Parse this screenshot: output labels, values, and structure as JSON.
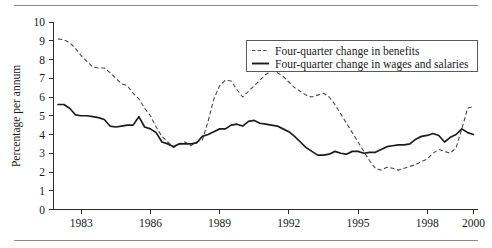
{
  "chart_data": {
    "type": "line",
    "title": "",
    "subtitle": "",
    "xlabel": "",
    "ylabel": "Percentage per annum",
    "xlim": [
      1981.8,
      2000.2
    ],
    "ylim": [
      0,
      10
    ],
    "yticks": [
      0,
      1,
      2,
      3,
      4,
      5,
      6,
      7,
      8,
      9,
      10
    ],
    "ytick_labels": [
      "0",
      "1",
      "2",
      "3",
      "4",
      "5",
      "6",
      "7",
      "8",
      "9",
      "10"
    ],
    "xticks": [
      1983,
      1986,
      1989,
      1992,
      1995,
      1998,
      2000
    ],
    "xtick_labels": [
      "1983",
      "1986",
      "1989",
      "1992",
      "1995",
      "1998",
      "2000"
    ],
    "grid": false,
    "legend_position": "top-right",
    "series": [
      {
        "name": "Four-quarter change in benefits",
        "style": "dashed",
        "color": "#4a4a4a",
        "x": [
          1982.0,
          1982.25,
          1982.5,
          1982.75,
          1983.0,
          1983.25,
          1983.5,
          1983.75,
          1984.0,
          1984.25,
          1984.5,
          1984.75,
          1985.0,
          1985.25,
          1985.5,
          1985.75,
          1986.0,
          1986.25,
          1986.5,
          1986.75,
          1987.0,
          1987.25,
          1987.5,
          1987.75,
          1988.0,
          1988.25,
          1988.5,
          1988.75,
          1989.0,
          1989.25,
          1989.5,
          1989.75,
          1990.0,
          1990.25,
          1990.5,
          1990.75,
          1991.0,
          1991.25,
          1991.5,
          1991.75,
          1992.0,
          1992.25,
          1992.5,
          1992.75,
          1993.0,
          1993.25,
          1993.5,
          1993.75,
          1994.0,
          1994.25,
          1994.5,
          1994.75,
          1995.0,
          1995.25,
          1995.5,
          1995.75,
          1996.0,
          1996.25,
          1996.5,
          1996.75,
          1997.0,
          1997.25,
          1997.5,
          1997.75,
          1998.0,
          1998.25,
          1998.5,
          1998.75,
          1999.0,
          1999.25,
          1999.5,
          1999.75,
          2000.0
        ],
        "values": [
          9.1,
          9.05,
          8.9,
          8.6,
          8.2,
          7.9,
          7.6,
          7.55,
          7.55,
          7.3,
          7.0,
          6.7,
          6.6,
          6.2,
          5.9,
          5.4,
          5.0,
          4.4,
          3.9,
          3.6,
          3.3,
          3.5,
          3.6,
          3.4,
          3.6,
          3.7,
          4.7,
          5.9,
          6.6,
          6.9,
          6.85,
          6.4,
          6.0,
          6.3,
          6.6,
          6.9,
          7.2,
          7.4,
          7.3,
          7.1,
          6.8,
          6.5,
          6.3,
          6.1,
          6.0,
          6.1,
          6.2,
          6.0,
          5.6,
          5.1,
          4.6,
          4.1,
          3.6,
          3.1,
          2.6,
          2.2,
          2.1,
          2.25,
          2.2,
          2.1,
          2.2,
          2.3,
          2.4,
          2.55,
          2.7,
          3.0,
          3.2,
          3.1,
          3.0,
          3.3,
          4.3,
          5.4,
          5.5
        ]
      },
      {
        "name": "Four-quarter change in wages and salaries",
        "style": "solid",
        "color": "#1c1c1c",
        "x": [
          1982.0,
          1982.25,
          1982.5,
          1982.75,
          1983.0,
          1983.25,
          1983.5,
          1983.75,
          1984.0,
          1984.25,
          1984.5,
          1984.75,
          1985.0,
          1985.25,
          1985.5,
          1985.75,
          1986.0,
          1986.25,
          1986.5,
          1986.75,
          1987.0,
          1987.25,
          1987.5,
          1987.75,
          1988.0,
          1988.25,
          1988.5,
          1988.75,
          1989.0,
          1989.25,
          1989.5,
          1989.75,
          1990.0,
          1990.25,
          1990.5,
          1990.75,
          1991.0,
          1991.25,
          1991.5,
          1991.75,
          1992.0,
          1992.25,
          1992.5,
          1992.75,
          1993.0,
          1993.25,
          1993.5,
          1993.75,
          1994.0,
          1994.25,
          1994.5,
          1994.75,
          1995.0,
          1995.25,
          1995.5,
          1995.75,
          1996.0,
          1996.25,
          1996.5,
          1996.75,
          1997.0,
          1997.25,
          1997.5,
          1997.75,
          1998.0,
          1998.25,
          1998.5,
          1998.75,
          1999.0,
          1999.25,
          1999.5,
          1999.75,
          2000.0
        ],
        "values": [
          5.6,
          5.6,
          5.4,
          5.05,
          5.0,
          5.0,
          4.95,
          4.9,
          4.8,
          4.45,
          4.4,
          4.45,
          4.5,
          4.5,
          4.95,
          4.4,
          4.3,
          4.1,
          3.6,
          3.5,
          3.35,
          3.5,
          3.5,
          3.5,
          3.55,
          3.9,
          4.0,
          4.15,
          4.3,
          4.3,
          4.5,
          4.55,
          4.45,
          4.7,
          4.75,
          4.6,
          4.55,
          4.5,
          4.45,
          4.3,
          4.15,
          3.9,
          3.6,
          3.3,
          3.1,
          2.9,
          2.9,
          2.95,
          3.1,
          3.0,
          2.95,
          3.1,
          3.1,
          3.0,
          3.05,
          3.05,
          3.2,
          3.35,
          3.4,
          3.45,
          3.45,
          3.5,
          3.75,
          3.9,
          3.95,
          4.05,
          3.95,
          3.6,
          3.85,
          4.0,
          4.3,
          4.1,
          4.0
        ]
      }
    ],
    "legend": [
      {
        "label": "Four-quarter change in benefits",
        "style": "dashed"
      },
      {
        "label": "Four-quarter change in wages and salaries",
        "style": "solid"
      }
    ]
  }
}
